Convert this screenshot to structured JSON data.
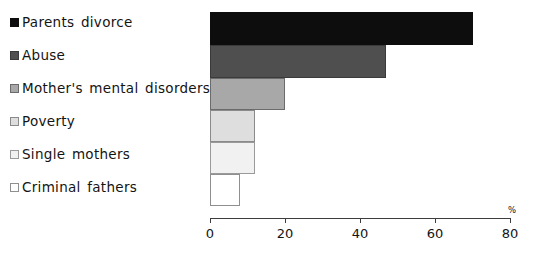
{
  "chart_data": {
    "type": "bar",
    "orientation": "horizontal",
    "title": "",
    "subtitle": "",
    "xlabel": "%",
    "ylabel": "",
    "xlim": [
      0,
      80
    ],
    "xticks": [
      0,
      20,
      40,
      60,
      80
    ],
    "grid": false,
    "legend_position": "left",
    "categories": [
      "Parents divorce",
      "Abuse",
      "Mother's mental disorders",
      "Poverty",
      "Single mothers",
      "Criminal fathers"
    ],
    "values": [
      70,
      47,
      20,
      12,
      12,
      8
    ],
    "series": [
      {
        "name": "",
        "values": [
          70,
          47,
          20,
          12,
          12,
          8
        ]
      }
    ],
    "colors": [
      "#0d0d0d",
      "#4f4f4f",
      "#a8a8a8",
      "#dedede",
      "#f1f1f1",
      "#ffffff"
    ]
  },
  "legend": {
    "items": [
      {
        "label": "Parents divorce",
        "color": "#0d0d0d"
      },
      {
        "label": "Abuse",
        "color": "#4f4f4f"
      },
      {
        "label": "Mother's mental disorders",
        "color": "#a8a8a8"
      },
      {
        "label": "Poverty",
        "color": "#dedede"
      },
      {
        "label": "Single mothers",
        "color": "#f1f1f1"
      },
      {
        "label": "Criminal fathers",
        "color": "#ffffff"
      }
    ]
  },
  "axis": {
    "unit": "%",
    "tick_labels": [
      "0",
      "20",
      "40",
      "60",
      "80"
    ]
  }
}
